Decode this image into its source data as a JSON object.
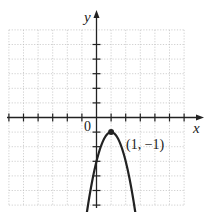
{
  "chart_data": {
    "type": "line",
    "title": "",
    "xlabel": "x",
    "ylabel": "y",
    "origin_label": "0",
    "xlim": [
      -6,
      7
    ],
    "ylim": [
      -6.5,
      6
    ],
    "grid": true,
    "equation_form": "parabola opening downward with vertex (1, -1)",
    "series": [
      {
        "name": "parabola",
        "vertex": [
          1,
          -1
        ],
        "x": [
          -0.8,
          -0.5,
          0,
          0.5,
          1,
          1.5,
          2,
          2.5,
          2.8
        ],
        "y": [
          -7.48,
          -5.5,
          -3,
          -1.5,
          -1,
          -1.5,
          -3,
          -5.5,
          -7.48
        ]
      }
    ],
    "annotations": [
      {
        "text": "(1, −1)",
        "x": 1,
        "y": -1
      }
    ]
  }
}
